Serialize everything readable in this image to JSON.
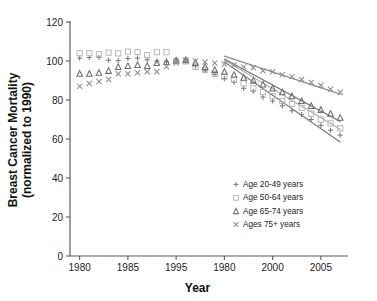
{
  "chart_data": {
    "type": "scatter",
    "title": "",
    "xlabel": "Year",
    "ylabel": "Breast Cancer Mortality (normalized to 1990)",
    "ylabel_line1": "Breast Cancer Mortality",
    "ylabel_line2": "(normalized to 1990)",
    "xlim": [
      1979,
      2007.5
    ],
    "ylim": [
      0,
      120
    ],
    "xticks": [
      1980,
      1985,
      1995,
      1980,
      2000,
      2005
    ],
    "xtick_values": [
      1980,
      1985,
      1990,
      1995,
      2000,
      2005
    ],
    "yticks": [
      0,
      20,
      40,
      60,
      80,
      100,
      120
    ],
    "grid": false,
    "legend_position": "lower-right",
    "series": [
      {
        "name": "Age 20-49 years",
        "label": "Age 20-49 years",
        "marker": "plus",
        "color": "#7a7a7a",
        "x": [
          1980,
          1981,
          1982,
          1983,
          1984,
          1985,
          1986,
          1987,
          1988,
          1989,
          1990,
          1991,
          1992,
          1993,
          1994,
          1995,
          1996,
          1997,
          1998,
          1999,
          2000,
          2001,
          2002,
          2003,
          2004,
          2005,
          2006,
          2007
        ],
        "y": [
          101.5,
          101.8,
          101.9,
          100.4,
          100.2,
          101.3,
          101.5,
          100.6,
          100.0,
          99.6,
          100.0,
          100.3,
          97.5,
          95.0,
          93.2,
          91.0,
          89.0,
          86.0,
          84.5,
          81.5,
          79.5,
          77.0,
          74.5,
          72.5,
          70.0,
          67.0,
          64.5,
          62.0
        ],
        "trend": {
          "x0": 1995,
          "y0": 99.5,
          "x1": 2007,
          "y1": 58.5
        }
      },
      {
        "name": "Age 50-64 years",
        "label": "Age 50-64 years",
        "marker": "square",
        "color": "#b0b0b0",
        "x": [
          1980,
          1981,
          1982,
          1983,
          1984,
          1985,
          1986,
          1987,
          1988,
          1989,
          1990,
          1991,
          1992,
          1993,
          1994,
          1995,
          1996,
          1997,
          1998,
          1999,
          2000,
          2001,
          2002,
          2003,
          2004,
          2005,
          2006,
          2007
        ],
        "y": [
          104.0,
          104.0,
          103.5,
          104.3,
          103.9,
          104.8,
          104.6,
          103.0,
          104.5,
          104.5,
          100.0,
          99.8,
          97.0,
          95.5,
          93.5,
          92.0,
          90.5,
          88.5,
          86.0,
          84.0,
          82.0,
          79.5,
          78.0,
          76.0,
          73.0,
          70.0,
          68.0,
          65.5
        ],
        "trend": {
          "x0": 1995,
          "y0": 100.5,
          "x1": 2007,
          "y1": 65.0
        }
      },
      {
        "name": "Age 65-74 years",
        "label": "Age 65-74 years",
        "marker": "triangle",
        "color": "#6e6e6e",
        "x": [
          1980,
          1981,
          1982,
          1983,
          1984,
          1985,
          1986,
          1987,
          1988,
          1989,
          1990,
          1991,
          1992,
          1993,
          1994,
          1995,
          1996,
          1997,
          1998,
          1999,
          2000,
          2001,
          2002,
          2003,
          2004,
          2005,
          2006,
          2007
        ],
        "y": [
          93.5,
          93.5,
          94.0,
          95.0,
          97.0,
          97.5,
          98.0,
          97.5,
          99.0,
          99.5,
          100.3,
          100.5,
          99.0,
          97.0,
          95.5,
          94.5,
          93.0,
          91.5,
          90.0,
          88.0,
          86.0,
          84.0,
          82.0,
          79.5,
          77.0,
          75.0,
          73.0,
          71.0
        ],
        "trend": {
          "x0": 1995,
          "y0": 101.0,
          "x1": 2007,
          "y1": 69.0
        }
      },
      {
        "name": "Ages 75+ years",
        "label": "Ages 75+ years",
        "marker": "cross",
        "color": "#8c8c8c",
        "x": [
          1980,
          1981,
          1982,
          1983,
          1984,
          1985,
          1986,
          1987,
          1988,
          1989,
          1990,
          1991,
          1992,
          1993,
          1994,
          1995,
          1996,
          1997,
          1998,
          1999,
          2000,
          2001,
          2002,
          2003,
          2004,
          2005,
          2006,
          2007
        ],
        "y": [
          87.0,
          88.5,
          89.5,
          90.5,
          93.5,
          93.5,
          94.0,
          94.5,
          94.5,
          97.0,
          99.0,
          100.5,
          100.0,
          99.5,
          99.0,
          98.5,
          98.0,
          97.0,
          96.5,
          95.0,
          94.5,
          93.0,
          92.0,
          90.5,
          89.0,
          87.5,
          85.5,
          84.0
        ],
        "trend": {
          "x0": 1995,
          "y0": 102.5,
          "x1": 2007,
          "y1": 83.0
        }
      }
    ]
  },
  "legend": {
    "entries": [
      {
        "label": "Age 20-49 years",
        "marker": "plus"
      },
      {
        "label": "Age 50-64 years",
        "marker": "square"
      },
      {
        "label": "Age 65-74 years",
        "marker": "triangle"
      },
      {
        "label": "Ages 75+ years",
        "marker": "cross"
      }
    ]
  },
  "colors": {
    "axis": "#5c5c5c",
    "text": "#1c1c1c",
    "background": "#ffffff"
  }
}
